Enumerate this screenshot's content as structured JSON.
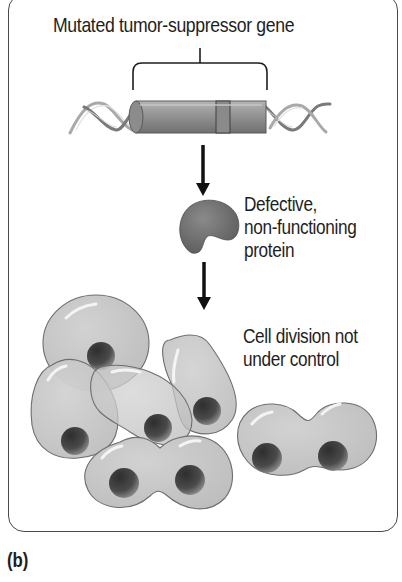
{
  "figure": {
    "panel_label": "(b)",
    "steps": [
      {
        "id": "gene",
        "label": "Mutated tumor-suppressor gene",
        "icon": "dna-double-helix-with-gene-segment"
      },
      {
        "id": "protein",
        "label_lines": [
          "Defective,",
          "non-functioning",
          "protein"
        ],
        "icon": "misfolded-protein-blob"
      },
      {
        "id": "cells",
        "label_lines": [
          "Cell division not",
          "under control"
        ],
        "icon": "cluster-of-dividing-cells"
      }
    ],
    "arrows": [
      {
        "from": "gene",
        "to": "protein"
      },
      {
        "from": "protein",
        "to": "cells"
      }
    ],
    "colors": {
      "frame": "#4a4a4a",
      "cell_fill": "#c4c4c4",
      "cell_outline": "#6e6e6e",
      "nucleus": "#4a4a4a",
      "protein": "#707070",
      "gene_cylinder": "#8a8a8a",
      "arrow": "#111111",
      "text": "#1e1e1e"
    }
  }
}
